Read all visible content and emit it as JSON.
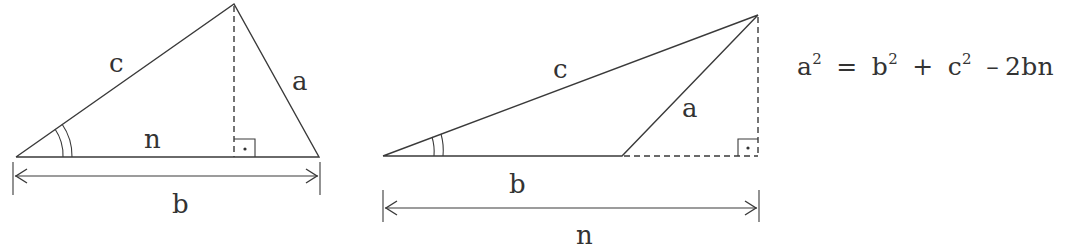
{
  "colors": {
    "stroke": "#3a3a3a",
    "text": "#333333",
    "background": "#ffffff"
  },
  "figure1": {
    "labels": {
      "c": "c",
      "a": "a",
      "n": "n",
      "b": "b"
    },
    "right_angle_marker": "·"
  },
  "figure2": {
    "labels": {
      "c": "c",
      "a": "a",
      "b": "b",
      "n": "n"
    },
    "right_angle_marker": "·"
  },
  "formula": {
    "lhs_base": "a",
    "lhs_exp": "2",
    "eq": "=",
    "t1_base": "b",
    "t1_exp": "2",
    "plus": "+",
    "t2_base": "c",
    "t2_exp": "2",
    "minus": "–",
    "t3": "2bn"
  }
}
